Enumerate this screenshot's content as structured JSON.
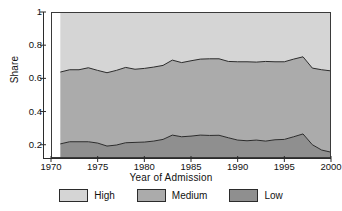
{
  "chart_data": {
    "type": "area",
    "title": "",
    "xlabel": "Year of Admission",
    "ylabel": "Share",
    "stacked": true,
    "grid": false,
    "legend_position": "bottom",
    "xlim": [
      1970,
      2000
    ],
    "ylim": [
      0.12,
      1
    ],
    "xticks": [
      1970,
      1975,
      1980,
      1985,
      1990,
      1995,
      2000
    ],
    "xtick_labels": [
      "1970",
      "1975",
      "1980",
      "1985",
      "1990",
      "1995",
      "2000"
    ],
    "yticks": [
      0.2,
      0.4,
      0.6,
      0.8,
      1
    ],
    "ytick_labels": [
      "0.2",
      "0.4",
      "0.6",
      "0.8",
      "1"
    ],
    "x": [
      1971,
      1972,
      1973,
      1974,
      1975,
      1976,
      1977,
      1978,
      1979,
      1980,
      1981,
      1982,
      1983,
      1984,
      1985,
      1986,
      1987,
      1988,
      1989,
      1990,
      1991,
      1992,
      1993,
      1994,
      1995,
      1996,
      1997,
      1998,
      1999,
      2000
    ],
    "series": [
      {
        "name": "Low",
        "color": "#8f8f8f",
        "cumulative_top": [
          0.205,
          0.218,
          0.218,
          0.218,
          0.21,
          0.192,
          0.198,
          0.212,
          0.214,
          0.216,
          0.222,
          0.232,
          0.258,
          0.248,
          0.252,
          0.258,
          0.256,
          0.257,
          0.242,
          0.228,
          0.224,
          0.228,
          0.222,
          0.23,
          0.232,
          0.248,
          0.265,
          0.2,
          0.168,
          0.155
        ],
        "values": [
          0.085,
          0.098,
          0.098,
          0.098,
          0.09,
          0.072,
          0.078,
          0.092,
          0.094,
          0.096,
          0.102,
          0.112,
          0.138,
          0.128,
          0.132,
          0.138,
          0.136,
          0.137,
          0.122,
          0.108,
          0.104,
          0.108,
          0.102,
          0.11,
          0.112,
          0.128,
          0.145,
          0.08,
          0.048,
          0.035
        ]
      },
      {
        "name": "Medium",
        "color": "#ababab",
        "cumulative_top": [
          0.638,
          0.652,
          0.652,
          0.664,
          0.648,
          0.634,
          0.648,
          0.666,
          0.655,
          0.66,
          0.668,
          0.678,
          0.71,
          0.695,
          0.706,
          0.716,
          0.718,
          0.718,
          0.702,
          0.7,
          0.7,
          0.698,
          0.702,
          0.7,
          0.7,
          0.716,
          0.73,
          0.662,
          0.652,
          0.645
        ],
        "values": [
          0.433,
          0.434,
          0.434,
          0.446,
          0.438,
          0.442,
          0.45,
          0.454,
          0.441,
          0.444,
          0.446,
          0.446,
          0.452,
          0.447,
          0.454,
          0.458,
          0.462,
          0.461,
          0.46,
          0.472,
          0.476,
          0.47,
          0.48,
          0.47,
          0.468,
          0.468,
          0.465,
          0.462,
          0.484,
          0.49
        ]
      },
      {
        "name": "High",
        "color": "#d5d5d5",
        "cumulative_top": [
          1,
          1,
          1,
          1,
          1,
          1,
          1,
          1,
          1,
          1,
          1,
          1,
          1,
          1,
          1,
          1,
          1,
          1,
          1,
          1,
          1,
          1,
          1,
          1,
          1,
          1,
          1,
          1,
          1,
          1
        ],
        "values": [
          0.362,
          0.348,
          0.348,
          0.336,
          0.352,
          0.366,
          0.352,
          0.334,
          0.345,
          0.34,
          0.332,
          0.322,
          0.29,
          0.305,
          0.294,
          0.284,
          0.282,
          0.282,
          0.298,
          0.3,
          0.3,
          0.302,
          0.298,
          0.3,
          0.3,
          0.284,
          0.27,
          0.338,
          0.348,
          0.355
        ]
      }
    ],
    "legend": [
      {
        "label": "High",
        "color": "#d5d5d5"
      },
      {
        "label": "Medium",
        "color": "#ababab"
      },
      {
        "label": "Low",
        "color": "#8f8f8f"
      }
    ]
  }
}
